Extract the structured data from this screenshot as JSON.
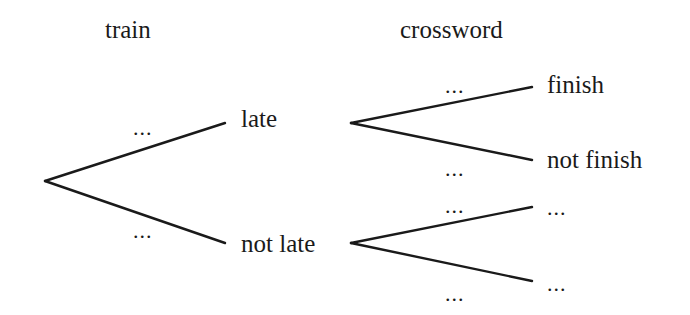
{
  "diagram": {
    "type": "tree-diagram",
    "headers": {
      "stage1": "train",
      "stage2": "crossword"
    },
    "stage1_branches": [
      {
        "label": "late",
        "probability": "..."
      },
      {
        "label": "not late",
        "probability": "..."
      }
    ],
    "stage2_branches": {
      "after_late": [
        {
          "label": "finish",
          "probability": "..."
        },
        {
          "label": "not finish",
          "probability": "..."
        }
      ],
      "after_not_late": [
        {
          "label": "...",
          "probability": "..."
        },
        {
          "label": "...",
          "probability": "..."
        }
      ]
    },
    "line_color": "#1a1a1a"
  }
}
